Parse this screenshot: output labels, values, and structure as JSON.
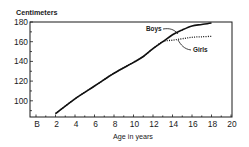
{
  "chart_data": {
    "type": "line",
    "title": "",
    "xlabel": "Age in years",
    "ylabel": "Centimeters",
    "xlim": [
      0,
      20
    ],
    "ylim": [
      84,
      180
    ],
    "x_ticks": [
      {
        "value": 0,
        "label": "B"
      },
      {
        "value": 2,
        "label": "2"
      },
      {
        "value": 4,
        "label": "4"
      },
      {
        "value": 6,
        "label": "6"
      },
      {
        "value": 8,
        "label": "8"
      },
      {
        "value": 10,
        "label": "10"
      },
      {
        "value": 12,
        "label": "12"
      },
      {
        "value": 14,
        "label": "14"
      },
      {
        "value": 16,
        "label": "16"
      },
      {
        "value": 18,
        "label": "18"
      },
      {
        "value": 20,
        "label": "20"
      }
    ],
    "y_ticks": [
      {
        "value": 100,
        "label": "100"
      },
      {
        "value": 120,
        "label": "120"
      },
      {
        "value": 140,
        "label": "140"
      },
      {
        "value": 160,
        "label": "160"
      },
      {
        "value": 180,
        "label": "180"
      }
    ],
    "grid": false,
    "legend_position": "inline annotations near curves",
    "series": [
      {
        "name": "Boys",
        "style": "solid",
        "x": [
          2,
          4,
          6,
          8,
          10,
          11,
          12,
          13,
          14,
          15,
          16,
          17,
          18
        ],
        "values": [
          87,
          102,
          115,
          128,
          139,
          145,
          153,
          160,
          167,
          172,
          176,
          177.5,
          179
        ]
      },
      {
        "name": "Girls",
        "style": "dotted",
        "x": [
          2,
          4,
          6,
          8,
          10,
          11,
          12,
          13,
          14,
          15,
          16,
          17,
          18
        ],
        "values": [
          87,
          102,
          115,
          128,
          139,
          145,
          153,
          160,
          161.5,
          163,
          164.5,
          165,
          165.5
        ]
      }
    ],
    "annotations": [
      {
        "text": "Boys",
        "points_to_series": "Boys",
        "at_x": 14.6
      },
      {
        "text": "Girls",
        "points_to_series": "Girls",
        "at_x": 14.3
      }
    ]
  },
  "labels": {
    "ylabel": "Centimeters",
    "xlabel": "Age in years",
    "boys": "Boys",
    "girls": "Girls"
  }
}
